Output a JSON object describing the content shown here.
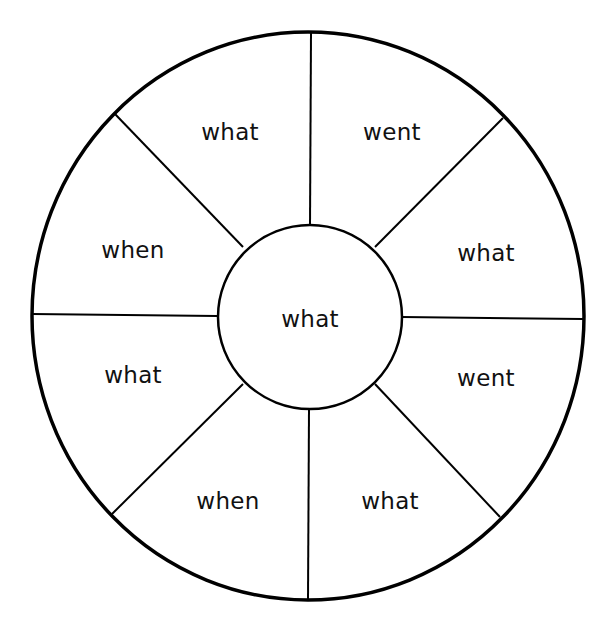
{
  "diagram": {
    "type": "word-wheel",
    "colors": {
      "background": "#ffffff",
      "stroke": "#000000",
      "text": "#111111"
    },
    "center": {
      "label": "what",
      "x": 310,
      "y": 327
    },
    "segments": [
      {
        "position": "top-left",
        "label": "what",
        "x": 230,
        "y": 140
      },
      {
        "position": "top-right",
        "label": "went",
        "x": 392,
        "y": 140
      },
      {
        "position": "right-upper",
        "label": "what",
        "x": 486,
        "y": 261
      },
      {
        "position": "right-lower",
        "label": "went",
        "x": 486,
        "y": 386
      },
      {
        "position": "bottom-right",
        "label": "what",
        "x": 390,
        "y": 509
      },
      {
        "position": "bottom-left",
        "label": "when",
        "x": 228,
        "y": 509
      },
      {
        "position": "left-lower",
        "label": "what",
        "x": 133,
        "y": 383
      },
      {
        "position": "left-upper",
        "label": "when",
        "x": 133,
        "y": 258
      }
    ]
  }
}
